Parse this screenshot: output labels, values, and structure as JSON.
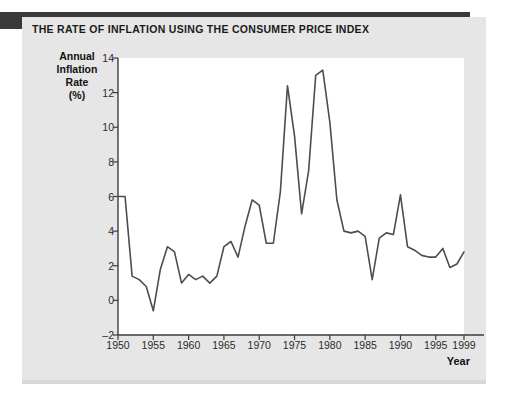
{
  "header": {
    "title": "THE RATE OF INFLATION USING THE CONSUMER PRICE INDEX"
  },
  "colors": {
    "line": "#4d4d4d",
    "axis": "#3d3d3d",
    "panel_bg": "#e6e6e6",
    "plot_bg": "#ffffff",
    "dark_bar": "#3a3a3a",
    "text": "#1a1a1a"
  },
  "axes": {
    "y_title_lines": [
      "Annual",
      "Inflation",
      "Rate",
      "(%)"
    ],
    "x_title": "Year",
    "y_ticks": [
      -2,
      0,
      2,
      4,
      6,
      8,
      10,
      12,
      14
    ],
    "y_tick_labels": [
      "–2",
      "0",
      "2",
      "4",
      "6",
      "8",
      "10",
      "12",
      "14"
    ],
    "x_ticks": [
      1950,
      1955,
      1960,
      1965,
      1970,
      1975,
      1980,
      1985,
      1990,
      1995,
      1999
    ],
    "x_tick_labels": [
      "1950",
      "1955",
      "1960",
      "1965",
      "1970",
      "1975",
      "1980",
      "1985",
      "1990",
      "1995",
      "1999"
    ]
  },
  "chart_data": {
    "type": "line",
    "title": "THE RATE OF INFLATION USING THE CONSUMER PRICE INDEX",
    "xlabel": "Year",
    "ylabel": "Annual Inflation Rate (%)",
    "xlim": [
      1950,
      1999
    ],
    "ylim": [
      -2,
      14
    ],
    "grid": false,
    "legend": false,
    "series": [
      {
        "name": "Annual Inflation Rate (%)",
        "x": [
          1950,
          1951,
          1952,
          1953,
          1954,
          1955,
          1956,
          1957,
          1958,
          1959,
          1960,
          1961,
          1962,
          1963,
          1964,
          1965,
          1966,
          1967,
          1968,
          1969,
          1970,
          1971,
          1972,
          1973,
          1974,
          1975,
          1976,
          1977,
          1978,
          1979,
          1980,
          1981,
          1982,
          1983,
          1984,
          1985,
          1986,
          1987,
          1988,
          1989,
          1990,
          1991,
          1992,
          1993,
          1994,
          1995,
          1996,
          1997,
          1998,
          1999
        ],
        "values": [
          6.0,
          6.0,
          1.4,
          1.2,
          0.8,
          -0.6,
          1.8,
          3.1,
          2.8,
          1.0,
          1.5,
          1.2,
          1.4,
          1.0,
          1.4,
          3.1,
          3.4,
          2.5,
          4.3,
          5.8,
          5.5,
          3.3,
          3.3,
          6.3,
          12.4,
          9.5,
          5.0,
          7.5,
          13.0,
          13.3,
          10.3,
          5.8,
          4.0,
          3.9,
          4.0,
          3.7,
          1.2,
          3.6,
          3.9,
          3.8,
          6.1,
          3.1,
          2.9,
          2.6,
          2.5,
          2.5,
          3.0,
          1.9,
          2.1,
          2.8
        ]
      }
    ]
  }
}
